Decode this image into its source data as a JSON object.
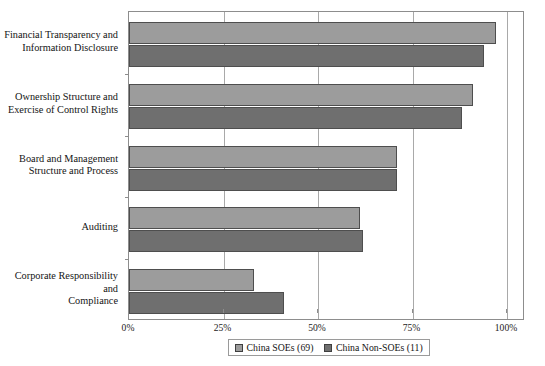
{
  "chart_data": {
    "type": "bar",
    "orientation": "horizontal",
    "xlabel": "",
    "ylabel": "",
    "xlim": [
      0,
      100
    ],
    "xticks": [
      0,
      25,
      50,
      75,
      100
    ],
    "xtick_labels": [
      "0%",
      "25%",
      "50%",
      "75%",
      "100%"
    ],
    "grid": true,
    "grid_axis": "x",
    "legend_position": "bottom",
    "categories": [
      "Financial Transparency and Information Disclosure",
      "Ownership Structure and Exercise of Control Rights",
      "Board and Management Structure and Process",
      "Auditing",
      "Corporate Responsibility and Compliance"
    ],
    "category_lines": [
      [
        "Financial Transparency and",
        "Information Disclosure"
      ],
      [
        "Ownership Structure and",
        "Exercise of Control Rights"
      ],
      [
        "Board and Management",
        "Structure and Process"
      ],
      [
        "Auditing"
      ],
      [
        "Corporate Responsibility and",
        "Compliance"
      ]
    ],
    "series": [
      {
        "name": "China SOEs (69)",
        "color": "#9c9c9c",
        "values": [
          97,
          91,
          71,
          61,
          33
        ]
      },
      {
        "name": "China Non-SOEs (11)",
        "color": "#6f6f6f",
        "values": [
          94,
          88,
          71,
          62,
          41
        ]
      }
    ]
  },
  "chart": {
    "title": "",
    "xticks": [
      "0%",
      "25%",
      "50%",
      "75%",
      "100%"
    ]
  },
  "legend": {
    "items": [
      {
        "label": "China SOEs (69)",
        "color": "#9c9c9c"
      },
      {
        "label": "China Non-SOEs (11)",
        "color": "#6f6f6f"
      }
    ]
  },
  "colors": {
    "series_light": "#9c9c9c",
    "series_dark": "#6f6f6f",
    "bar_border": "#4e4e4e",
    "axis": "#8d8d8d",
    "gridline": "#a9a9a9",
    "background": "#ffffff",
    "text": "#141414"
  }
}
